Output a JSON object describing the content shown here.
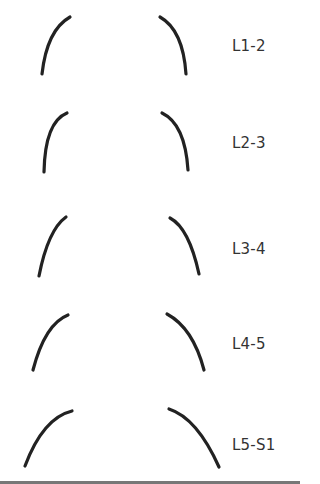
{
  "diagram": {
    "stroke_color": "#222222",
    "levels": [
      {
        "label": "L1-2",
        "label_y": 37,
        "left": {
          "d": "M70,17 Q47,30 42,74"
        },
        "right": {
          "d": "M160,17 Q183,30 186,74"
        }
      },
      {
        "label": "L2-3",
        "label_y": 134,
        "left": {
          "d": "M67,113 Q45,122 44,172"
        },
        "right": {
          "d": "M162,113 Q185,124 188,170"
        }
      },
      {
        "label": "L3-4",
        "label_y": 240,
        "left": {
          "d": "M66,217 Q48,230 39,276"
        },
        "right": {
          "d": "M170,218 Q189,228 199,274"
        }
      },
      {
        "label": "L4-5",
        "label_y": 335,
        "left": {
          "d": "M68,315 Q45,324 33,370"
        },
        "right": {
          "d": "M167,314 Q193,328 204,370"
        }
      },
      {
        "label": "L5-S1",
        "label_y": 436,
        "left": {
          "d": "M72,411 Q43,418 25,466"
        },
        "right": {
          "d": "M169,409 Q197,418 219,467"
        }
      }
    ]
  }
}
